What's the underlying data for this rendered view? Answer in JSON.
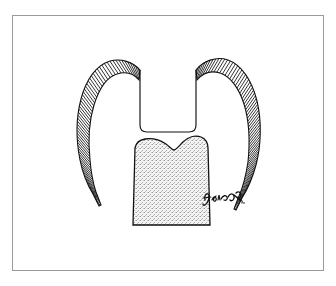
{
  "page": {
    "background_color": "#ffffff",
    "width": 336,
    "height": 286
  },
  "frame": {
    "border_color": "#9a9a9a",
    "fill_color": "#ffffff",
    "x": 12,
    "y": 15,
    "width": 312,
    "height": 256
  },
  "illustration": {
    "title": "Dental cross-section: cast crown seated over prepared tooth core",
    "type": "line-drawing",
    "ink_color": "#111111",
    "stipple_color": "#b9b9b9",
    "stipple_background": "#f2f2f2",
    "parts": [
      {
        "name": "left-crown-arm",
        "label": "Left crown wall (cross-hatched metal casting)",
        "fill_pattern": "parallel-hatch",
        "hatch_count": 62
      },
      {
        "name": "right-crown-arm",
        "label": "Right crown wall (cross-hatched metal casting)",
        "fill_pattern": "parallel-hatch",
        "hatch_count": 66
      },
      {
        "name": "occlusal-notch",
        "label": "Central occlusal groove / flat-bottom notch",
        "fill_pattern": "none"
      },
      {
        "name": "tooth-core",
        "label": "Prepared tooth core (stippled dentin)",
        "fill_pattern": "stipple"
      }
    ]
  },
  "signature": {
    "name": "artist-signature",
    "text": "",
    "description": "Handwritten cursive artist signature, illegible",
    "x": 204,
    "y": 196,
    "color": "#111111"
  }
}
